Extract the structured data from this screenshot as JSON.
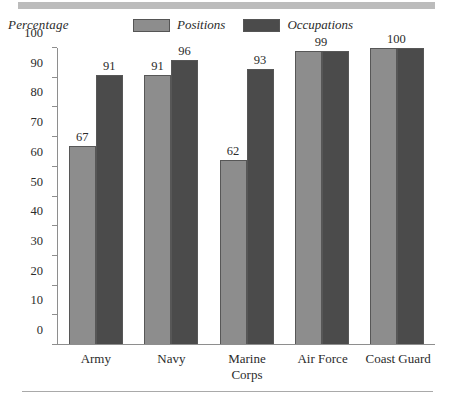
{
  "axis_title": "Percentage",
  "legend": [
    {
      "label": "Positions",
      "key": "series-a",
      "color": "#8d8d8d"
    },
    {
      "label": "Occupations",
      "key": "series-b",
      "color": "#4b4b4b"
    }
  ],
  "chart_data": {
    "type": "bar",
    "title": "",
    "xlabel": "",
    "ylabel": "Percentage",
    "ylim": [
      0,
      100
    ],
    "yticks": [
      0,
      10,
      20,
      30,
      40,
      50,
      60,
      70,
      80,
      90,
      100
    ],
    "grid": false,
    "legend_position": "top",
    "categories": [
      "Army",
      "Navy",
      "Marine Corps",
      "Air Force",
      "Coast Guard"
    ],
    "series": [
      {
        "name": "Positions",
        "values": [
          67,
          91,
          62,
          99,
          100
        ]
      },
      {
        "name": "Occupations",
        "values": [
          91,
          96,
          93,
          99,
          100
        ]
      }
    ],
    "data_labels": [
      {
        "category": "Army",
        "positions": "67",
        "occupations": "91",
        "shared": false
      },
      {
        "category": "Navy",
        "positions": "91",
        "occupations": "96",
        "shared": false
      },
      {
        "category": "Marine Corps",
        "positions": "62",
        "occupations": "93",
        "shared": false
      },
      {
        "category": "Air Force",
        "positions": "99",
        "occupations": "",
        "shared": true
      },
      {
        "category": "Coast Guard",
        "positions": "100",
        "occupations": "",
        "shared": true
      }
    ]
  }
}
